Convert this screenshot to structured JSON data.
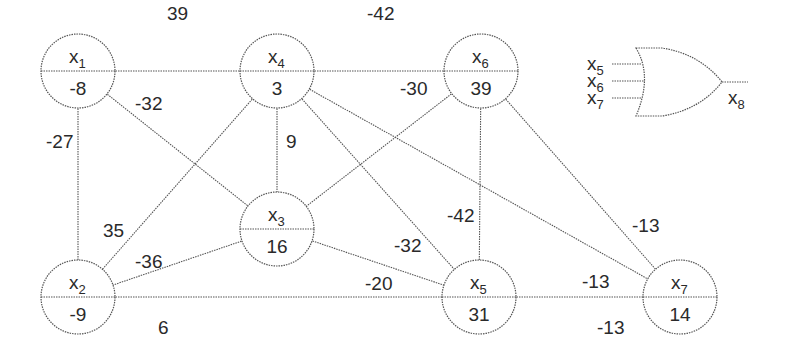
{
  "diagram": {
    "type": "weighted-graph-with-or-gate",
    "nodes": [
      {
        "id": "x1",
        "name": "x",
        "sub": "1",
        "value": "-8",
        "cx": 78,
        "cy": 71
      },
      {
        "id": "x2",
        "name": "x",
        "sub": "2",
        "value": "-9",
        "cx": 78,
        "cy": 297
      },
      {
        "id": "x3",
        "name": "x",
        "sub": "3",
        "value": "16",
        "cx": 277,
        "cy": 229
      },
      {
        "id": "x4",
        "name": "x",
        "sub": "4",
        "value": "3",
        "cx": 277,
        "cy": 71
      },
      {
        "id": "x5",
        "name": "x",
        "sub": "5",
        "value": "31",
        "cx": 479,
        "cy": 297
      },
      {
        "id": "x6",
        "name": "x",
        "sub": "6",
        "value": "39",
        "cx": 481,
        "cy": 71
      },
      {
        "id": "x7",
        "name": "x",
        "sub": "7",
        "value": "14",
        "cx": 680,
        "cy": 297
      }
    ],
    "edges": [
      {
        "from": "x1",
        "to": "x4",
        "weight": "39",
        "lx": 167,
        "ly": 20
      },
      {
        "from": "x1",
        "to": "x2",
        "weight": "-27",
        "lx": 46,
        "ly": 148
      },
      {
        "from": "x1",
        "to": "x3",
        "weight": "-32",
        "lx": 135,
        "ly": 110
      },
      {
        "from": "x4",
        "to": "x6",
        "weight": "-42",
        "lx": 367,
        "ly": 20
      },
      {
        "from": "x4",
        "to": "x3",
        "weight": "9",
        "lx": 286,
        "ly": 148
      },
      {
        "from": "x4",
        "to": "x2",
        "weight": "35",
        "lx": 103,
        "ly": 237
      },
      {
        "from": "x4",
        "to": "x5",
        "weight": "-32",
        "lx": 394,
        "ly": 252
      },
      {
        "from": "x4",
        "to": "x7",
        "weight": "-13",
        "lx": 582,
        "ly": 288
      },
      {
        "from": "x6",
        "to": "x3",
        "weight": "-30",
        "lx": 400,
        "ly": 95
      },
      {
        "from": "x6",
        "to": "x5",
        "weight": "-42",
        "lx": 447,
        "ly": 222
      },
      {
        "from": "x6",
        "to": "x7",
        "weight": "-13",
        "lx": 632,
        "ly": 232
      },
      {
        "from": "x3",
        "to": "x2",
        "weight": "-36",
        "lx": 135,
        "ly": 268
      },
      {
        "from": "x3",
        "to": "x5",
        "weight": "-20",
        "lx": 365,
        "ly": 290
      },
      {
        "from": "x2",
        "to": "x5",
        "weight": "6",
        "lx": 158,
        "ly": 334
      },
      {
        "from": "x5",
        "to": "x7",
        "weight": "-13",
        "lx": 597,
        "ly": 334
      }
    ],
    "or_gate": {
      "inputs": [
        {
          "name": "x",
          "sub": "5"
        },
        {
          "name": "x",
          "sub": "6"
        },
        {
          "name": "x",
          "sub": "7"
        }
      ],
      "output": {
        "name": "x",
        "sub": "8"
      }
    }
  }
}
